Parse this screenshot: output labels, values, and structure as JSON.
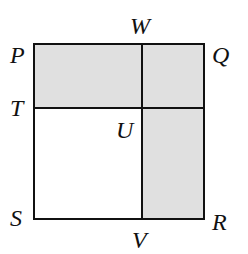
{
  "diagram": {
    "type": "geometry-figure",
    "colors": {
      "shade": "#e0e0e0",
      "stroke": "#111111",
      "background": "#ffffff"
    },
    "square": {
      "left": 34,
      "top": 44,
      "right": 204,
      "bottom": 219
    },
    "divider_x": 142,
    "divider_y": 108,
    "points": [
      {
        "id": "P",
        "label": "P",
        "x": 10,
        "y": 63
      },
      {
        "id": "W",
        "label": "W",
        "x": 130,
        "y": 34
      },
      {
        "id": "Q",
        "label": "Q",
        "x": 212,
        "y": 63
      },
      {
        "id": "T",
        "label": "T",
        "x": 10,
        "y": 116
      },
      {
        "id": "U",
        "label": "U",
        "x": 116,
        "y": 138
      },
      {
        "id": "S",
        "label": "S",
        "x": 10,
        "y": 226
      },
      {
        "id": "V",
        "label": "V",
        "x": 132,
        "y": 248
      },
      {
        "id": "R",
        "label": "R",
        "x": 212,
        "y": 230
      }
    ],
    "shaded_regions": [
      "PQ-top-band",
      "UV-right-column"
    ]
  }
}
